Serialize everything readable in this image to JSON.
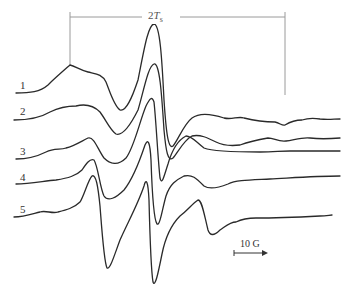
{
  "figure": {
    "type": "EPR spectra stack",
    "span_marker": {
      "label_prefix": "2",
      "label_symbol": "T",
      "label_subscript": "s"
    },
    "scale_bar": {
      "label": "10 G"
    },
    "traces": [
      {
        "id": "1",
        "label": "1"
      },
      {
        "id": "2",
        "label": "2"
      },
      {
        "id": "3",
        "label": "3"
      },
      {
        "id": "4",
        "label": "4"
      },
      {
        "id": "5",
        "label": "5"
      }
    ],
    "colors": {
      "trace": "#2a2a2a",
      "marker": "#9a9a9a"
    }
  }
}
